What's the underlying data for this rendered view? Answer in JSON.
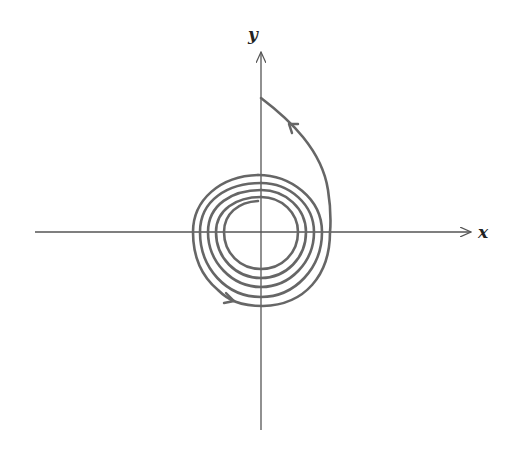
{
  "diagram": {
    "type": "phase-portrait",
    "axes": {
      "x_label": "x",
      "y_label": "y"
    },
    "colors": {
      "axis": "#555555",
      "trajectory": "#666666",
      "label": "#222222"
    },
    "trajectory": {
      "start_point": "on positive y-axis",
      "direction": "clockwise, inward",
      "arrow_count": 2
    }
  }
}
